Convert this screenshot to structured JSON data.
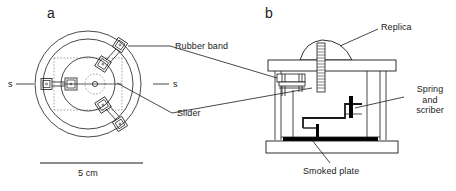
{
  "figure": {
    "type": "scientific-apparatus-diagram",
    "panels": [
      {
        "letter": "a",
        "view": "top view",
        "labels": {
          "rubber_band": "Rubber band",
          "slider": "Slider",
          "axis_left": "s",
          "axis_right": "s"
        },
        "scale_bar": {
          "length_label": "5 cm"
        }
      },
      {
        "letter": "b",
        "view": "side cross-section view",
        "labels": {
          "replica": "Replica",
          "spring_and_scriber_line1": "Spring",
          "spring_and_scriber_line2": "and",
          "spring_and_scriber_line3": "scriber",
          "smoked_plate": "Smoked plate"
        }
      }
    ]
  },
  "colors": {
    "line": "#1a1a1a",
    "text": "#1a1a1a",
    "background": "#ffffff",
    "fill_dark": "#000000",
    "dashed": "#555555"
  }
}
